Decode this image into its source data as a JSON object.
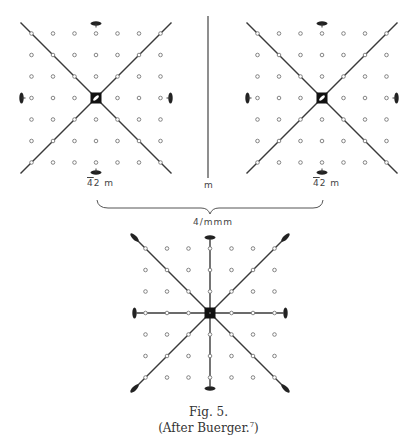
{
  "figure": {
    "caption": "Fig. 5.",
    "attribution_prefix": "(After Buerger.",
    "attribution_ref": "7",
    "attribution_suffix": ")"
  },
  "panels": {
    "left": {
      "label_bar": "4",
      "label_rest": "2 m",
      "description": "Point group 4-bar 2 m: 7x7 lattice with diagonal mirror lines, 4-bar axis at center, 2-fold diads at edge midpoints"
    },
    "middle": {
      "label": "m",
      "description": "Vertical mirror plane"
    },
    "right": {
      "label_bar": "4",
      "label_rest": "2 m",
      "description": "Point group 4-bar 2 m: 7x7 lattice, mirror-related copy"
    },
    "combined": {
      "label": "4/mmm",
      "description": "Combination: 7x7 lattice with 4 mirror lines, 4-fold axis at center, 2-fold diads at line ends"
    }
  },
  "colors": {
    "line": "#3a3a3a",
    "dot": "#777777",
    "text": "#333333",
    "background": "#ffffff"
  }
}
